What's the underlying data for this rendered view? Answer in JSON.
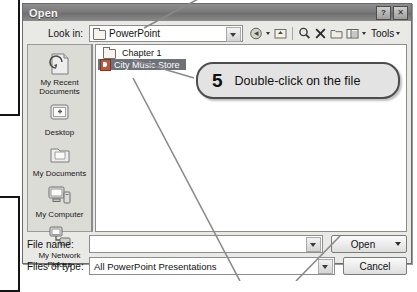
{
  "dialog": {
    "title": "Open",
    "titlebar_buttons": [
      {
        "name": "help-button",
        "glyph": "?"
      },
      {
        "name": "close-button",
        "glyph": "✕"
      }
    ],
    "lookin": {
      "label": "Look in:",
      "value": "PowerPoint"
    },
    "toolbar": {
      "tools_label": "Tools",
      "icons": [
        "back-arrow-icon",
        "up-one-level-icon",
        "search-icon",
        "delete-icon",
        "new-folder-icon",
        "views-icon"
      ]
    },
    "places_bar": [
      {
        "label": "My Recent Documents",
        "icon": "recent-documents-icon"
      },
      {
        "label": "Desktop",
        "icon": "desktop-icon"
      },
      {
        "label": "My Documents",
        "icon": "my-documents-icon"
      },
      {
        "label": "My Computer",
        "icon": "my-computer-icon"
      },
      {
        "label": "My Network Places",
        "icon": "my-network-places-icon"
      }
    ],
    "file_list": [
      {
        "name": "Chapter 1",
        "type": "folder",
        "selected": false
      },
      {
        "name": "City Music Store",
        "type": "presentation",
        "selected": true
      }
    ],
    "file_name": {
      "label": "File name:",
      "value": ""
    },
    "files_of_type": {
      "label": "Files of type:",
      "value": "All PowerPoint Presentations"
    },
    "buttons": {
      "open": "Open",
      "cancel": "Cancel"
    }
  },
  "callout": {
    "number": "5",
    "text": "Double-click on the file"
  },
  "colors": {
    "selection": "#6d7278",
    "dialog_face": "#e9e9e6",
    "titlebar": "#7b7b7b",
    "callout_fill": "#e3e3e3"
  }
}
